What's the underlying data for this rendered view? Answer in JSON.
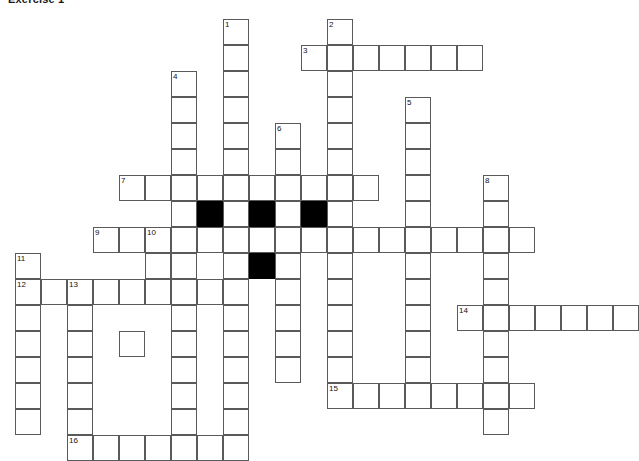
{
  "title": "Exercise 1",
  "puzzle": {
    "type": "crossword-grid",
    "cell_size": 26,
    "origin": {
      "x": 15,
      "y": 19
    },
    "colors": {
      "background": "#ffffff",
      "grid_line": "#5a5a5a",
      "blocked_cell": "#000000",
      "number_text": "#111111"
    },
    "clue_numbers": [
      1,
      2,
      3,
      4,
      5,
      6,
      7,
      8,
      9,
      10,
      11,
      12,
      13,
      14,
      15,
      16
    ],
    "entries": [
      {
        "number": "1",
        "direction": "down",
        "col": 8,
        "row": 0,
        "length": 13
      },
      {
        "number": "2",
        "direction": "down",
        "col": 12,
        "row": 0,
        "length": 9
      },
      {
        "number": "3",
        "direction": "across",
        "col": 11,
        "row": 1,
        "length": 7
      },
      {
        "number": "4",
        "direction": "down",
        "col": 6,
        "row": 2,
        "length": 12
      },
      {
        "number": "5",
        "direction": "down",
        "col": 15,
        "row": 3,
        "length": 13
      },
      {
        "number": "6",
        "direction": "down",
        "col": 10,
        "row": 4,
        "length": 10
      },
      {
        "number": "7",
        "direction": "across",
        "col": 4,
        "row": 6,
        "length": 10
      },
      {
        "number": "8",
        "direction": "down",
        "col": 18,
        "row": 6,
        "length": 9
      },
      {
        "number": "9",
        "direction": "across",
        "col": 3,
        "row": 8,
        "length": 17
      },
      {
        "number": "10",
        "direction": "down",
        "col": 5,
        "row": 8,
        "length": 5
      },
      {
        "number": "11",
        "direction": "down",
        "col": 0,
        "row": 9,
        "length": 2
      },
      {
        "number": "12",
        "direction": "across",
        "col": 0,
        "row": 10,
        "length": 8
      },
      {
        "number": "13",
        "direction": "down",
        "col": 2,
        "row": 10,
        "length": 7
      },
      {
        "number": "14",
        "direction": "across",
        "col": 17,
        "row": 11,
        "length": 7
      },
      {
        "number": "15",
        "direction": "across",
        "col": 12,
        "row": 14,
        "length": 8
      },
      {
        "number": "16",
        "direction": "across",
        "col": 2,
        "row": 16,
        "length": 7
      }
    ],
    "cells": [
      {
        "col": 8,
        "row": 0,
        "num": "1"
      },
      {
        "col": 12,
        "row": 0,
        "num": "2"
      },
      {
        "col": 8,
        "row": 1
      },
      {
        "col": 11,
        "row": 1,
        "num": "3"
      },
      {
        "col": 12,
        "row": 1
      },
      {
        "col": 13,
        "row": 1
      },
      {
        "col": 14,
        "row": 1
      },
      {
        "col": 15,
        "row": 1
      },
      {
        "col": 16,
        "row": 1
      },
      {
        "col": 17,
        "row": 1
      },
      {
        "col": 6,
        "row": 2,
        "num": "4"
      },
      {
        "col": 8,
        "row": 2
      },
      {
        "col": 12,
        "row": 2
      },
      {
        "col": 6,
        "row": 3
      },
      {
        "col": 8,
        "row": 3
      },
      {
        "col": 12,
        "row": 3
      },
      {
        "col": 15,
        "row": 3,
        "num": "5"
      },
      {
        "col": 6,
        "row": 4
      },
      {
        "col": 8,
        "row": 4
      },
      {
        "col": 10,
        "row": 4,
        "num": "6"
      },
      {
        "col": 12,
        "row": 4
      },
      {
        "col": 15,
        "row": 4
      },
      {
        "col": 6,
        "row": 5
      },
      {
        "col": 8,
        "row": 5
      },
      {
        "col": 10,
        "row": 5
      },
      {
        "col": 12,
        "row": 5
      },
      {
        "col": 15,
        "row": 5
      },
      {
        "col": 4,
        "row": 6,
        "num": "7"
      },
      {
        "col": 5,
        "row": 6
      },
      {
        "col": 6,
        "row": 6
      },
      {
        "col": 7,
        "row": 6
      },
      {
        "col": 8,
        "row": 6
      },
      {
        "col": 9,
        "row": 6
      },
      {
        "col": 10,
        "row": 6
      },
      {
        "col": 11,
        "row": 6
      },
      {
        "col": 12,
        "row": 6
      },
      {
        "col": 13,
        "row": 6
      },
      {
        "col": 15,
        "row": 6
      },
      {
        "col": 18,
        "row": 6,
        "num": "8"
      },
      {
        "col": 6,
        "row": 7
      },
      {
        "col": 7,
        "row": 7,
        "black": true
      },
      {
        "col": 8,
        "row": 7
      },
      {
        "col": 9,
        "row": 7,
        "black": true
      },
      {
        "col": 10,
        "row": 7
      },
      {
        "col": 11,
        "row": 7,
        "black": true
      },
      {
        "col": 12,
        "row": 7
      },
      {
        "col": 15,
        "row": 7
      },
      {
        "col": 18,
        "row": 7
      },
      {
        "col": 3,
        "row": 8,
        "num": "9"
      },
      {
        "col": 4,
        "row": 8
      },
      {
        "col": 5,
        "row": 8,
        "num": "10"
      },
      {
        "col": 6,
        "row": 8
      },
      {
        "col": 7,
        "row": 8
      },
      {
        "col": 8,
        "row": 8
      },
      {
        "col": 9,
        "row": 8
      },
      {
        "col": 10,
        "row": 8
      },
      {
        "col": 11,
        "row": 8
      },
      {
        "col": 12,
        "row": 8
      },
      {
        "col": 13,
        "row": 8
      },
      {
        "col": 14,
        "row": 8
      },
      {
        "col": 15,
        "row": 8
      },
      {
        "col": 16,
        "row": 8
      },
      {
        "col": 17,
        "row": 8
      },
      {
        "col": 18,
        "row": 8
      },
      {
        "col": 19,
        "row": 8
      },
      {
        "col": 0,
        "row": 9,
        "num": "11"
      },
      {
        "col": 5,
        "row": 9
      },
      {
        "col": 6,
        "row": 9
      },
      {
        "col": 8,
        "row": 9
      },
      {
        "col": 9,
        "row": 9,
        "black": true
      },
      {
        "col": 10,
        "row": 9
      },
      {
        "col": 12,
        "row": 9
      },
      {
        "col": 15,
        "row": 9
      },
      {
        "col": 18,
        "row": 9
      },
      {
        "col": 0,
        "row": 10,
        "num": "12"
      },
      {
        "col": 1,
        "row": 10
      },
      {
        "col": 2,
        "row": 10,
        "num": "13"
      },
      {
        "col": 3,
        "row": 10
      },
      {
        "col": 4,
        "row": 10
      },
      {
        "col": 5,
        "row": 10
      },
      {
        "col": 6,
        "row": 10
      },
      {
        "col": 7,
        "row": 10
      },
      {
        "col": 8,
        "row": 10
      },
      {
        "col": 10,
        "row": 10
      },
      {
        "col": 12,
        "row": 10
      },
      {
        "col": 15,
        "row": 10
      },
      {
        "col": 18,
        "row": 10
      },
      {
        "col": 0,
        "row": 11
      },
      {
        "col": 2,
        "row": 11
      },
      {
        "col": 6,
        "row": 11
      },
      {
        "col": 8,
        "row": 11
      },
      {
        "col": 10,
        "row": 11
      },
      {
        "col": 12,
        "row": 11
      },
      {
        "col": 15,
        "row": 11
      },
      {
        "col": 17,
        "row": 11,
        "num": "14"
      },
      {
        "col": 18,
        "row": 11
      },
      {
        "col": 19,
        "row": 11
      },
      {
        "col": 20,
        "row": 11
      },
      {
        "col": 21,
        "row": 11
      },
      {
        "col": 22,
        "row": 11
      },
      {
        "col": 23,
        "row": 11
      },
      {
        "col": 0,
        "row": 12
      },
      {
        "col": 2,
        "row": 12
      },
      {
        "col": 4,
        "row": 12
      },
      {
        "col": 6,
        "row": 12
      },
      {
        "col": 8,
        "row": 12
      },
      {
        "col": 10,
        "row": 12
      },
      {
        "col": 12,
        "row": 12
      },
      {
        "col": 15,
        "row": 12
      },
      {
        "col": 18,
        "row": 12
      },
      {
        "col": 0,
        "row": 13
      },
      {
        "col": 2,
        "row": 13
      },
      {
        "col": 6,
        "row": 13
      },
      {
        "col": 8,
        "row": 13
      },
      {
        "col": 10,
        "row": 13
      },
      {
        "col": 12,
        "row": 13
      },
      {
        "col": 15,
        "row": 13
      },
      {
        "col": 18,
        "row": 13
      },
      {
        "col": 0,
        "row": 14
      },
      {
        "col": 2,
        "row": 14
      },
      {
        "col": 6,
        "row": 14
      },
      {
        "col": 8,
        "row": 14
      },
      {
        "col": 12,
        "row": 14,
        "num": "15"
      },
      {
        "col": 13,
        "row": 14
      },
      {
        "col": 14,
        "row": 14
      },
      {
        "col": 15,
        "row": 14
      },
      {
        "col": 16,
        "row": 14
      },
      {
        "col": 17,
        "row": 14
      },
      {
        "col": 18,
        "row": 14
      },
      {
        "col": 19,
        "row": 14
      },
      {
        "col": 0,
        "row": 15
      },
      {
        "col": 2,
        "row": 15
      },
      {
        "col": 6,
        "row": 15
      },
      {
        "col": 8,
        "row": 15
      },
      {
        "col": 18,
        "row": 15
      },
      {
        "col": 2,
        "row": 16,
        "num": "16"
      },
      {
        "col": 3,
        "row": 16
      },
      {
        "col": 4,
        "row": 16
      },
      {
        "col": 5,
        "row": 16
      },
      {
        "col": 6,
        "row": 16
      },
      {
        "col": 7,
        "row": 16
      },
      {
        "col": 8,
        "row": 16
      }
    ]
  }
}
